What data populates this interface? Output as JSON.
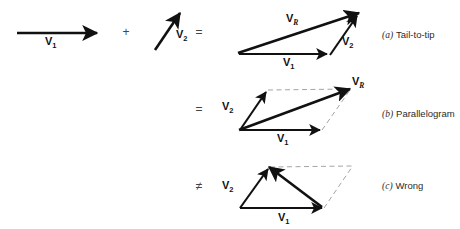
{
  "figure": {
    "background_color": "#ffffff",
    "ink_color": "#111111",
    "dash_color": "#9a9a9a",
    "operators": {
      "plus": "+",
      "equals_top": "=",
      "equals_middle": "=",
      "not_equals_bottom": "≠"
    },
    "labels": {
      "v": "V",
      "sub_1": "1",
      "sub_2": "2",
      "sub_R": "R"
    },
    "source_vectors": [
      {
        "name": "v1-source",
        "label_base": "V",
        "label_sub": "1"
      },
      {
        "name": "v2-source",
        "label_base": "V",
        "label_sub": "2"
      }
    ],
    "panels": [
      {
        "id": "a",
        "letter": "(a)",
        "caption": "Tail-to-tip",
        "operator": "=",
        "vectors": [
          "V1",
          "V2",
          "VR"
        ]
      },
      {
        "id": "b",
        "letter": "(b)",
        "caption": "Parallelogram",
        "operator": "=",
        "vectors": [
          "V1",
          "V2",
          "VR"
        ]
      },
      {
        "id": "c",
        "letter": "(c)",
        "caption": "Wrong",
        "operator": "≠",
        "vectors": [
          "V1",
          "V2"
        ]
      }
    ]
  }
}
